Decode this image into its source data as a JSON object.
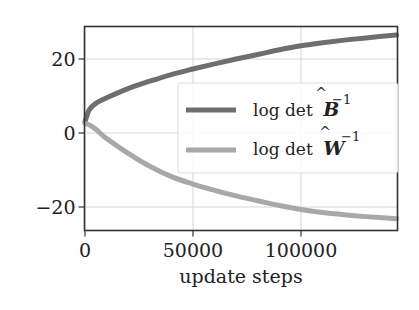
{
  "chart_data": {
    "type": "line",
    "title": "",
    "xlabel": "update steps",
    "ylabel": "",
    "xlim": [
      0,
      145000
    ],
    "ylim": [
      -26,
      28
    ],
    "grid": true,
    "legend_position": "center right",
    "x_ticks": [
      0,
      50000,
      100000
    ],
    "x_tick_labels": [
      "0",
      "50000",
      "100000"
    ],
    "y_ticks": [
      20,
      0,
      -20
    ],
    "y_tick_labels": [
      "20",
      "0",
      "−20"
    ],
    "x": [
      0,
      2000,
      5000,
      10000,
      20000,
      30000,
      40000,
      50000,
      60000,
      70000,
      80000,
      90000,
      100000,
      110000,
      120000,
      130000,
      145000
    ],
    "series": [
      {
        "name": "log det B^-1",
        "label_prefix": "log det",
        "symbol": "B",
        "superscript": "−1",
        "color": "#6e6e6e",
        "values": [
          3.0,
          6.3,
          8.0,
          9.5,
          12.0,
          14.0,
          15.8,
          17.3,
          18.7,
          20.0,
          21.2,
          22.5,
          23.6,
          24.4,
          25.1,
          25.7,
          26.5
        ]
      },
      {
        "name": "log det W^-1",
        "label_prefix": "log det",
        "symbol": "W",
        "superscript": "−1",
        "color": "#a8a8a8",
        "values": [
          2.6,
          2.2,
          1.0,
          -1.5,
          -5.5,
          -9.0,
          -11.8,
          -13.8,
          -15.5,
          -17.0,
          -18.3,
          -19.6,
          -20.7,
          -21.5,
          -22.1,
          -22.6,
          -23.2
        ]
      }
    ]
  }
}
